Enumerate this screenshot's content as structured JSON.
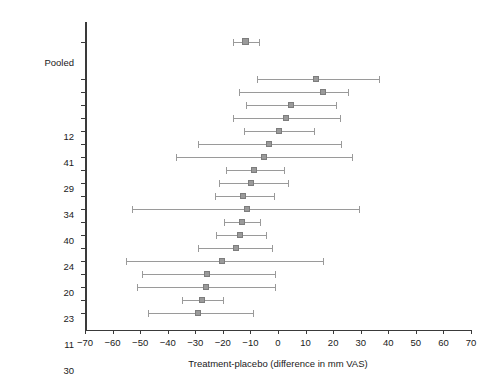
{
  "chart_data": {
    "type": "scatter",
    "title": "",
    "subtitle": "",
    "xlabel": "Treatment-placebo (difference in mm VAS)",
    "ylabel": "Reference no.",
    "xlim": [
      -70,
      70
    ],
    "xticks": [
      -70,
      -60,
      -50,
      -40,
      -30,
      -20,
      -10,
      0,
      10,
      20,
      30,
      40,
      50,
      60,
      70
    ],
    "xtick_labels": [
      "−70",
      "−60",
      "−50",
      "−40",
      "−30",
      "−20",
      "−10",
      "0",
      "10",
      "20",
      "30",
      "40",
      "50",
      "60",
      "70"
    ],
    "grid": false,
    "legend": "none",
    "reference_line": 0,
    "categories": [
      "Pooled",
      "12",
      "41",
      "29",
      "34",
      "40",
      "24",
      "20",
      "23",
      "11",
      "30",
      "31",
      "27",
      "33",
      "2",
      "25",
      "28",
      "32",
      "21",
      "19"
    ],
    "series": [
      {
        "name": "Treatment-placebo difference (mm VAS)",
        "points": [
          {
            "label": "Pooled",
            "estimate": -11.5,
            "ci_low": -16.5,
            "ci_high": -7.0,
            "pooled": true
          },
          {
            "label": "12",
            "estimate": 14.0,
            "ci_low": -7.5,
            "ci_high": 36.5
          },
          {
            "label": "41",
            "estimate": 16.5,
            "ci_low": -14.0,
            "ci_high": 25.5
          },
          {
            "label": "29",
            "estimate": 5.0,
            "ci_low": -11.5,
            "ci_high": 21.0
          },
          {
            "label": "34",
            "estimate": 3.0,
            "ci_low": -16.5,
            "ci_high": 22.5
          },
          {
            "label": "40",
            "estimate": 0.5,
            "ci_low": -12.5,
            "ci_high": 13.0
          },
          {
            "label": "24",
            "estimate": -3.0,
            "ci_low": -29.0,
            "ci_high": 23.0
          },
          {
            "label": "20",
            "estimate": -5.0,
            "ci_low": -37.0,
            "ci_high": 27.0
          },
          {
            "label": "23",
            "estimate": -8.5,
            "ci_low": -19.0,
            "ci_high": 2.0
          },
          {
            "label": "11",
            "estimate": -9.5,
            "ci_low": -21.5,
            "ci_high": 3.5
          },
          {
            "label": "30",
            "estimate": -12.5,
            "ci_low": -23.0,
            "ci_high": -1.5
          },
          {
            "label": "31",
            "estimate": -11.0,
            "ci_low": -53.0,
            "ci_high": 29.5
          },
          {
            "label": "27",
            "estimate": -13.0,
            "ci_low": -19.5,
            "ci_high": -6.5
          },
          {
            "label": "33",
            "estimate": -13.5,
            "ci_low": -22.5,
            "ci_high": -4.5
          },
          {
            "label": "2",
            "estimate": -15.0,
            "ci_low": -29.0,
            "ci_high": -2.0
          },
          {
            "label": "25",
            "estimate": -20.0,
            "ci_low": -55.0,
            "ci_high": 16.5
          },
          {
            "label": "28",
            "estimate": -25.5,
            "ci_low": -49.5,
            "ci_high": -1.0
          },
          {
            "label": "32",
            "estimate": -26.0,
            "ci_low": -51.0,
            "ci_high": -1.0
          },
          {
            "label": "21",
            "estimate": -27.5,
            "ci_low": -35.0,
            "ci_high": -20.0
          },
          {
            "label": "19",
            "estimate": -29.0,
            "ci_low": -47.0,
            "ci_high": -9.0
          }
        ]
      }
    ],
    "colors": {
      "marker": "#9a9a9a",
      "ci_line": "#9a9a9a",
      "axis": "#3a3a3a",
      "text": "#1a1a1a",
      "background": "#ffffff"
    }
  }
}
